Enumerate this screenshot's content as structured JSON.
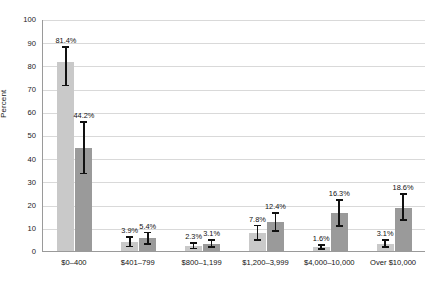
{
  "chart_data": {
    "type": "bar",
    "title": "",
    "xlabel": "",
    "ylabel": "Percent",
    "ylim": [
      0,
      100
    ],
    "yticks": [
      0,
      10,
      20,
      30,
      40,
      50,
      60,
      70,
      80,
      90,
      100
    ],
    "ytick_labels": [
      "0",
      "10",
      "20",
      "30",
      "40",
      "50",
      "60",
      "70",
      "80",
      "90",
      "100"
    ],
    "grid": true,
    "legend_position": "top-center",
    "categories": [
      "$0–400",
      "$401–799",
      "$800–1,199",
      "$1,200–3,999",
      "$4,000–10,000",
      "Over $10,000"
    ],
    "series": [
      {
        "name": "Personal wealth",
        "color": "#c9c9c9",
        "values": [
          81.4,
          3.9,
          2.3,
          7.8,
          1.6,
          3.1
        ],
        "labels": [
          "81.4%",
          "3.9%",
          "2.3%",
          "7.8%",
          "1.6%",
          "3.1%"
        ],
        "error_low": [
          71.0,
          1.6,
          0.8,
          4.3,
          0.4,
          1.3
        ],
        "error_high": [
          88.2,
          6.4,
          3.9,
          11.4,
          3.0,
          5.0
        ]
      },
      {
        "name": "Personal and family wealth",
        "color": "#9a9a9a",
        "values": [
          44.2,
          5.4,
          3.1,
          12.4,
          16.3,
          18.6
        ],
        "labels": [
          "44.2%",
          "5.4%",
          "3.1%",
          "12.4%",
          "16.3%",
          "18.6%"
        ],
        "error_low": [
          33.0,
          2.6,
          1.3,
          8.2,
          10.5,
          12.9
        ],
        "error_high": [
          56.0,
          8.3,
          5.0,
          16.8,
          22.3,
          24.9
        ]
      }
    ]
  },
  "legend": {
    "items": [
      {
        "label": "Personal wealth",
        "color": "#c9c9c9"
      },
      {
        "label": "Personal and family wealth",
        "color": "#9a9a9a"
      }
    ]
  },
  "axis": {
    "y_title": "Percent"
  },
  "colors": {
    "series_1": "#c9c9c9",
    "series_2": "#9a9a9a",
    "gridline": "#d9d9d9",
    "axis": "#9a9a9a",
    "error_bar": "#111111",
    "background": "#ffffff"
  }
}
